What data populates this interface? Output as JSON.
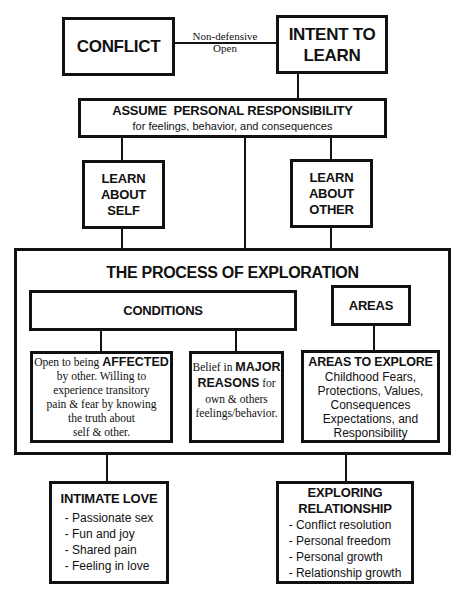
{
  "diagram": {
    "conflict": {
      "label": "CONFLICT"
    },
    "connector_label": {
      "line1": "Non-defensive",
      "line2": "Open"
    },
    "intent": {
      "line1": "INTENT TO",
      "line2": "LEARN"
    },
    "responsibility": {
      "title": "ASSUME  PERSONAL RESPONSIBILITY",
      "subtitle": "for feelings, behavior, and consequences"
    },
    "learn_self": {
      "line1": "LEARN",
      "line2": "ABOUT",
      "line3": "SELF"
    },
    "learn_other": {
      "line1": "LEARN",
      "line2": "ABOUT",
      "line3": "OTHER"
    },
    "process": {
      "title": "THE PROCESS OF EXPLORATION"
    },
    "conditions": {
      "label": "CONDITIONS"
    },
    "areas": {
      "label": "AREAS"
    },
    "affected": {
      "prefix": "Open to being ",
      "emphasis": "AFFECTED",
      "line2": "by other. Willing to",
      "line3": "experience transitory",
      "line4": "pain & fear by knowing",
      "line5": "the truth about",
      "line6": "self & other."
    },
    "major": {
      "prefix": "Belief in ",
      "emphasis1": "MAJOR",
      "emphasis2": "REASONS",
      "suffix": " for",
      "line3": "own & others",
      "line4": "feelings/behavior."
    },
    "areas_to_explore": {
      "title": "AREAS TO EXPLORE",
      "lines": [
        "Childhood Fears,",
        "Protections, Values,",
        "Consequences",
        "Expectations, and",
        "Responsibility"
      ]
    },
    "intimate_love": {
      "title": "INTIMATE LOVE",
      "items": [
        "- Passionate sex",
        "- Fun and joy",
        "- Shared pain",
        "- Feeling in love"
      ]
    },
    "exploring_relationship": {
      "title1": "EXPLORING",
      "title2": "RELATIONSHIP",
      "items": [
        "- Conflict resolution",
        "- Personal freedom",
        "- Personal growth",
        "- Relationship growth"
      ]
    }
  }
}
